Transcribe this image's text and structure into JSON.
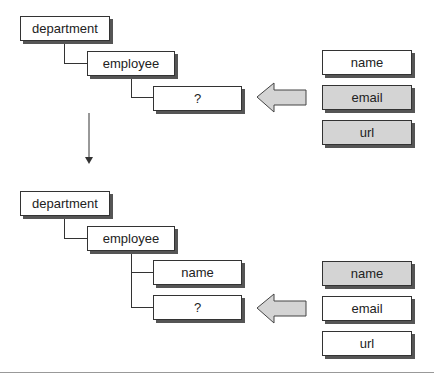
{
  "top": {
    "tree": {
      "root": "department",
      "child": "employee",
      "grandchild": "?"
    },
    "candidates": [
      {
        "label": "name",
        "highlighted": false
      },
      {
        "label": "email",
        "highlighted": true
      },
      {
        "label": "url",
        "highlighted": true
      }
    ]
  },
  "bottom": {
    "tree": {
      "root": "department",
      "child": "employee",
      "grandchildren": [
        "name",
        "?"
      ]
    },
    "candidates": [
      {
        "label": "name",
        "highlighted": true
      },
      {
        "label": "email",
        "highlighted": false
      },
      {
        "label": "url",
        "highlighted": false
      }
    ]
  },
  "colors": {
    "highlight_fill": "#d4d4d4",
    "arrow_fill": "#d4d4d4",
    "border": "#333333"
  }
}
